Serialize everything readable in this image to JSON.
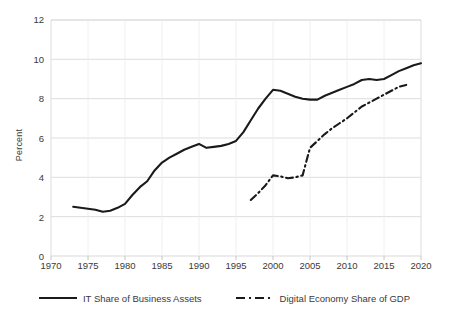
{
  "chart_data": {
    "type": "line",
    "title": "",
    "xlabel": "",
    "ylabel": "Percent",
    "xlim": [
      1970,
      2020
    ],
    "ylim": [
      0,
      12
    ],
    "xticks": [
      1970,
      1975,
      1980,
      1985,
      1990,
      1995,
      2000,
      2005,
      2010,
      2015,
      2020
    ],
    "yticks": [
      0,
      2,
      4,
      6,
      8,
      10,
      12
    ],
    "grid": "horizontal",
    "legend_position": "bottom",
    "series": [
      {
        "name": "IT Share of Business Assets",
        "style": "solid",
        "color": "#1a1a1a",
        "x": [
          1973,
          1974,
          1975,
          1976,
          1977,
          1978,
          1979,
          1980,
          1981,
          1982,
          1983,
          1984,
          1985,
          1986,
          1987,
          1988,
          1989,
          1990,
          1991,
          1992,
          1993,
          1994,
          1995,
          1996,
          1997,
          1998,
          1999,
          2000,
          2001,
          2002,
          2003,
          2004,
          2005,
          2006,
          2007,
          2008,
          2009,
          2010,
          2011,
          2012,
          2013,
          2014,
          2015,
          2016,
          2017,
          2018,
          2019,
          2020
        ],
        "values": [
          2.5,
          2.45,
          2.4,
          2.35,
          2.25,
          2.3,
          2.45,
          2.65,
          3.1,
          3.5,
          3.8,
          4.35,
          4.75,
          5.0,
          5.2,
          5.4,
          5.55,
          5.7,
          5.5,
          5.55,
          5.6,
          5.7,
          5.85,
          6.3,
          6.9,
          7.5,
          8.0,
          8.45,
          8.4,
          8.25,
          8.1,
          8.0,
          7.95,
          7.95,
          8.15,
          8.3,
          8.45,
          8.6,
          8.75,
          8.95,
          9.0,
          8.95,
          9.0,
          9.2,
          9.4,
          9.55,
          9.7,
          9.8
        ]
      },
      {
        "name": "Digital Economy Share of GDP",
        "style": "dash-dot",
        "color": "#1a1a1a",
        "x": [
          1997,
          1998,
          1999,
          2000,
          2001,
          2002,
          2003,
          2004,
          2005,
          2006,
          2007,
          2008,
          2009,
          2010,
          2011,
          2012,
          2013,
          2014,
          2015,
          2016,
          2017,
          2018
        ],
        "values": [
          2.85,
          3.2,
          3.6,
          4.1,
          4.05,
          3.95,
          4.0,
          4.1,
          5.5,
          5.85,
          6.2,
          6.5,
          6.75,
          7.0,
          7.3,
          7.6,
          7.8,
          8.0,
          8.2,
          8.4,
          8.6,
          8.7
        ]
      }
    ]
  },
  "axis": {
    "y_label": "Percent",
    "y_ticks": [
      "0",
      "2",
      "4",
      "6",
      "8",
      "10",
      "12"
    ],
    "x_ticks": [
      "1970",
      "1975",
      "1980",
      "1985",
      "1990",
      "1995",
      "2000",
      "2005",
      "2010",
      "2015",
      "2020"
    ]
  },
  "legend": {
    "items": [
      {
        "label": "IT Share of Business Assets",
        "style": "solid"
      },
      {
        "label": "Digital Economy Share of GDP",
        "style": "dash-dot"
      }
    ]
  },
  "colors": {
    "line": "#1a1a1a",
    "grid": "#d9d9d9",
    "text": "#3a3a3a",
    "background": "#ffffff"
  }
}
